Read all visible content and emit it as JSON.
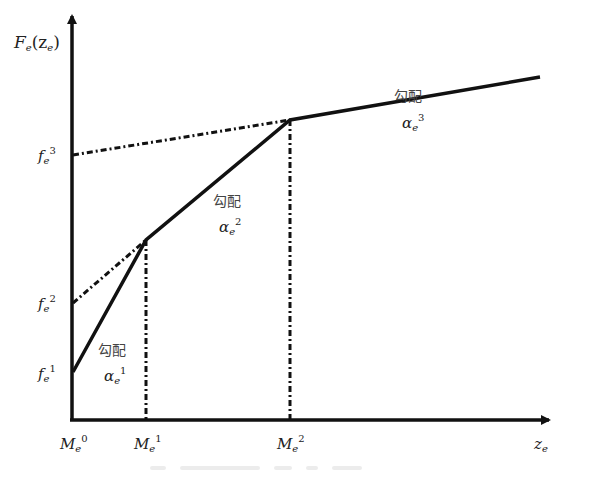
{
  "diagram": {
    "type": "piecewise-linear-function",
    "y_axis_label": {
      "main": "F",
      "sub": "e",
      "arg": "(z",
      "arg_sub": "e",
      "close": ")"
    },
    "x_axis_label": {
      "main": "z",
      "sub": "e"
    },
    "y_ticks": [
      {
        "main": "f",
        "sub": "e",
        "sup": "1"
      },
      {
        "main": "f",
        "sub": "e",
        "sup": "2"
      },
      {
        "main": "f",
        "sub": "e",
        "sup": "3"
      }
    ],
    "x_ticks": [
      {
        "main": "M",
        "sub": "e",
        "sup": "0"
      },
      {
        "main": "M",
        "sub": "e",
        "sup": "1"
      },
      {
        "main": "M",
        "sub": "e",
        "sup": "2"
      }
    ],
    "segments": [
      {
        "label": "勾配",
        "slope": {
          "main": "α",
          "sub": "e",
          "sup": "1"
        }
      },
      {
        "label": "勾配",
        "slope": {
          "main": "α",
          "sub": "e",
          "sup": "2"
        }
      },
      {
        "label": "勾配",
        "slope": {
          "main": "α",
          "sub": "e",
          "sup": "3"
        }
      }
    ],
    "colors": {
      "line": "#111111",
      "text": "#222222"
    }
  }
}
